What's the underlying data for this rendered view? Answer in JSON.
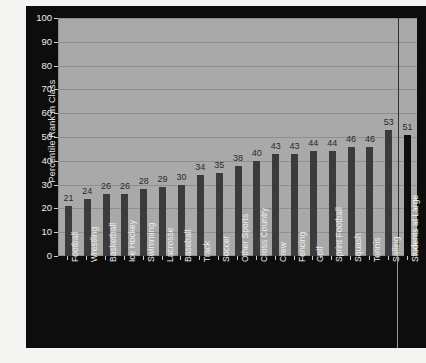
{
  "chart_data": {
    "type": "bar",
    "title": "",
    "xlabel": "",
    "ylabel": "Percentile Rank in Class",
    "ylim": [
      0,
      100
    ],
    "yticks": [
      0,
      10,
      20,
      30,
      40,
      50,
      60,
      70,
      80,
      90,
      100
    ],
    "grid": true,
    "legend": false,
    "categories": [
      "Football",
      "Wrestling",
      "Basketball",
      "Ice Hockey",
      "Swimming",
      "Lacrosse",
      "Baseball",
      "Track",
      "Soccer",
      "Other Sports",
      "Cross Country",
      "Crew",
      "Fencing",
      "Golf",
      "Sprint Football",
      "Squash",
      "Tennis",
      "Sailing",
      "Students at Large"
    ],
    "values": [
      21,
      24,
      26,
      26,
      28,
      29,
      30,
      34,
      35,
      38,
      40,
      43,
      43,
      44,
      44,
      46,
      46,
      53,
      51
    ],
    "value_labels": [
      "21",
      "24",
      "26",
      "26",
      "28",
      "29",
      "30",
      "34",
      "35",
      "38",
      "40",
      "43",
      "43",
      "44",
      "44",
      "46",
      "46",
      "53",
      "51"
    ],
    "reference_index": 18,
    "colors": {
      "bar": "#3b3b3b",
      "reference_bar": "#0e0e0e",
      "plot_background": "#a9a9a9",
      "panel_background": "#0d0d0d",
      "gridline": "#8f8f8f",
      "axis_text": "#ededed",
      "value_text": "#2a2a2a",
      "figure_background": "#f4f4f2"
    }
  }
}
